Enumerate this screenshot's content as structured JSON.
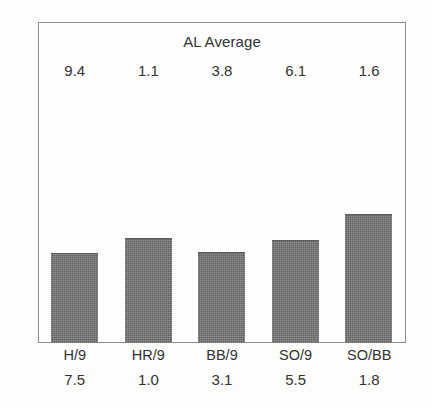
{
  "chart_data": {
    "type": "bar",
    "title": "AL Average",
    "xlabel": "",
    "ylabel": "",
    "grid": false,
    "legend": "none",
    "categories": [
      "H/9",
      "HR/9",
      "BB/9",
      "SO/9",
      "SO/BB"
    ],
    "series": [
      {
        "name": "AL Average",
        "position": "above-plot",
        "values": [
          9.4,
          1.1,
          3.8,
          6.1,
          1.6
        ],
        "labels": [
          "9.4",
          "1.1",
          "3.8",
          "6.1",
          "1.6"
        ]
      },
      {
        "name": "Player",
        "position": "below-axis",
        "values": [
          7.5,
          1.0,
          3.1,
          5.5,
          1.8
        ],
        "labels": [
          "7.5",
          "1.0",
          "3.1",
          "5.5",
          "1.8"
        ]
      }
    ],
    "bar_heights_px": [
      90,
      105,
      91,
      103,
      129
    ],
    "bar_color": "#6d6d6d",
    "frame_color": "#8d8d8d",
    "background_color": "#fdfdfc"
  },
  "chart": {
    "title": "AL Average",
    "top_values": [
      "9.4",
      "1.1",
      "3.8",
      "6.1",
      "1.6"
    ],
    "category_labels": [
      "H/9",
      "HR/9",
      "BB/9",
      "SO/9",
      "SO/BB"
    ],
    "bottom_values": [
      "7.5",
      "1.0",
      "3.1",
      "5.5",
      "1.8"
    ],
    "bars": [
      {
        "category": "H/9",
        "height_px": 90
      },
      {
        "category": "HR/9",
        "height_px": 105
      },
      {
        "category": "BB/9",
        "height_px": 91
      },
      {
        "category": "SO/9",
        "height_px": 103
      },
      {
        "category": "SO/BB",
        "height_px": 129
      }
    ]
  }
}
